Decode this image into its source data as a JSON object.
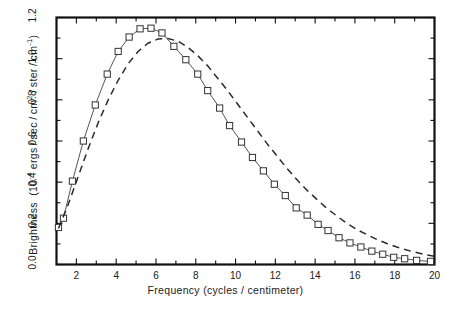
{
  "chart_data": {
    "type": "line",
    "title": "",
    "xlabel": "Frequency  (cycles / centimeter)",
    "ylabel": "Brightness  (10⁻⁴ ergs/sec/cm²/ster/cm⁻¹)",
    "ylabel_parts": {
      "prefix": "Brightness  (10",
      "exponent": "-4",
      "suffix": " ergs/sec/cm"
    },
    "xlim": [
      1,
      20
    ],
    "ylim": [
      0.0,
      1.2
    ],
    "grid": false,
    "legend": "none",
    "xticks": [
      2,
      4,
      6,
      8,
      10,
      12,
      14,
      16,
      18,
      20
    ],
    "xtick_labels": [
      "2",
      "4",
      "6",
      "8",
      "10",
      "12",
      "14",
      "16",
      "18",
      "20"
    ],
    "xticks_minor": [
      1,
      3,
      5,
      7,
      9,
      11,
      13,
      15,
      17,
      19
    ],
    "yticks": [
      0.0,
      0.2,
      0.4,
      0.6,
      0.8,
      1.0,
      1.2
    ],
    "ytick_labels": [
      "0.0",
      "0.2",
      "0.4",
      "0.6",
      "0.8",
      "1.0",
      "1.2"
    ],
    "yticks_minor": [
      0.1,
      0.3,
      0.5,
      0.7,
      0.9,
      1.1
    ],
    "series": [
      {
        "name": "measured-spectrum",
        "style": "solid-line-with-open-square-markers",
        "marker": "open-square",
        "color": "#555555",
        "x": [
          1.1,
          1.35,
          1.8,
          2.35,
          2.95,
          3.55,
          4.1,
          4.65,
          5.2,
          5.75,
          6.3,
          6.9,
          7.5,
          8.1,
          8.6,
          9.2,
          9.7,
          10.3,
          10.85,
          11.4,
          11.95,
          12.5,
          13.05,
          13.6,
          14.15,
          14.65,
          15.2,
          15.75,
          16.3,
          16.85,
          17.4,
          17.95,
          18.5,
          19.1,
          19.8
        ],
        "y": [
          0.18,
          0.225,
          0.405,
          0.6,
          0.775,
          0.925,
          1.035,
          1.105,
          1.145,
          1.148,
          1.125,
          1.06,
          0.995,
          0.925,
          0.845,
          0.76,
          0.675,
          0.595,
          0.52,
          0.455,
          0.39,
          0.335,
          0.275,
          0.24,
          0.195,
          0.165,
          0.13,
          0.105,
          0.085,
          0.065,
          0.05,
          0.035,
          0.028,
          0.02,
          0.015
        ]
      },
      {
        "name": "blackbody-fit",
        "style": "dashed-line",
        "marker": "none",
        "color": "#2b2b2b",
        "x": [
          1.1,
          1.6,
          2.1,
          2.6,
          3.1,
          3.6,
          4.1,
          4.6,
          5.1,
          5.6,
          6.1,
          6.6,
          7.1,
          7.6,
          8.1,
          8.6,
          9.1,
          9.6,
          10.1,
          10.6,
          11.1,
          11.6,
          12.1,
          12.6,
          13.1,
          13.6,
          14.1,
          14.6,
          15.1,
          15.6,
          16.1,
          16.6,
          17.1,
          17.6,
          18.1,
          18.6,
          19.1,
          19.6,
          20.0
        ],
        "y": [
          0.175,
          0.295,
          0.43,
          0.565,
          0.69,
          0.8,
          0.895,
          0.975,
          1.035,
          1.075,
          1.095,
          1.098,
          1.085,
          1.055,
          1.015,
          0.965,
          0.905,
          0.845,
          0.78,
          0.715,
          0.65,
          0.585,
          0.525,
          0.465,
          0.41,
          0.36,
          0.315,
          0.272,
          0.235,
          0.2,
          0.17,
          0.145,
          0.122,
          0.102,
          0.085,
          0.07,
          0.058,
          0.047,
          0.04
        ]
      }
    ]
  }
}
